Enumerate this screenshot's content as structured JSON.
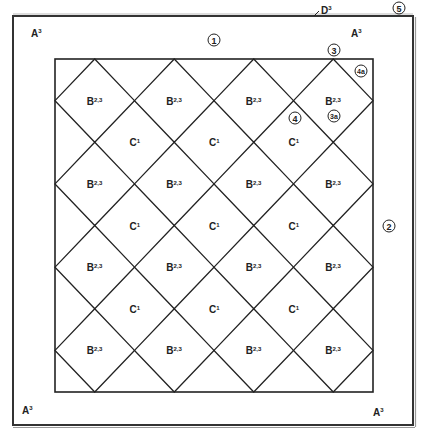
{
  "diagram": {
    "type": "quilt-layout",
    "outer_border_label": "D",
    "outer_border_sup": "3",
    "corner_labels": [
      {
        "text": "A",
        "sup": "3",
        "position": "top-left"
      },
      {
        "text": "A",
        "sup": "3",
        "position": "top-right"
      },
      {
        "text": "A",
        "sup": "3",
        "position": "bottom-left"
      },
      {
        "text": "A",
        "sup": "3",
        "position": "bottom-right"
      }
    ],
    "circled_numbers": [
      {
        "text": "1",
        "position": "top-border-center"
      },
      {
        "text": "2",
        "position": "right-border-middle"
      },
      {
        "text": "3",
        "position": "top-right-diamond-apex"
      },
      {
        "text": "4",
        "position": "inside-c-block"
      },
      {
        "text": "5",
        "position": "outer-top-right-corner"
      },
      {
        "text": "4a",
        "position": "top-right-corner-triangle"
      },
      {
        "text": "3a",
        "position": "top-right-b-block"
      }
    ],
    "grid": {
      "columns": 4,
      "rows": 4,
      "b_label": "B",
      "b_sup": "2,3",
      "c_label": "C",
      "c_sup": "1",
      "c_rows": 3,
      "c_columns": 3
    }
  }
}
